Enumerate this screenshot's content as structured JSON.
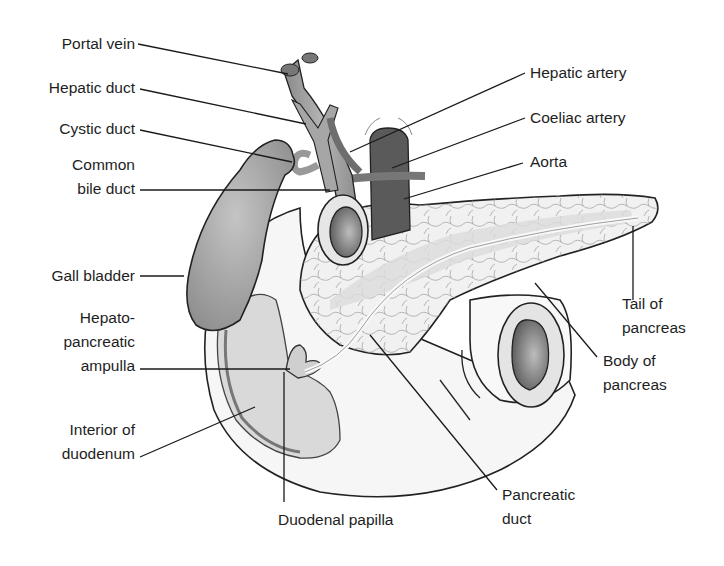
{
  "diagram": {
    "labels_left": [
      {
        "id": "portal-vein",
        "lines": [
          "Portal vein"
        ]
      },
      {
        "id": "hepatic-duct",
        "lines": [
          "Hepatic duct"
        ]
      },
      {
        "id": "cystic-duct",
        "lines": [
          "Cystic duct"
        ]
      },
      {
        "id": "common-bile-duct",
        "lines": [
          "Common",
          "bile duct"
        ]
      },
      {
        "id": "gall-bladder",
        "lines": [
          "Gall bladder"
        ]
      },
      {
        "id": "hepato-pancreatic-ampulla",
        "lines": [
          "Hepato-",
          "pancreatic",
          "ampulla"
        ]
      },
      {
        "id": "interior-of-duodenum",
        "lines": [
          "Interior of",
          "duodenum"
        ]
      }
    ],
    "labels_right": [
      {
        "id": "hepatic-artery",
        "lines": [
          "Hepatic artery"
        ]
      },
      {
        "id": "coeliac-artery",
        "lines": [
          "Coeliac artery"
        ]
      },
      {
        "id": "aorta",
        "lines": [
          "Aorta"
        ]
      },
      {
        "id": "tail-of-pancreas",
        "lines": [
          "Tail of",
          "pancreas"
        ]
      },
      {
        "id": "body-of-pancreas",
        "lines": [
          "Body of",
          "pancreas"
        ]
      }
    ],
    "labels_bottom": [
      {
        "id": "duodenal-papilla",
        "lines": [
          "Duodenal papilla"
        ]
      },
      {
        "id": "pancreatic-duct",
        "lines": [
          "Pancreatic",
          "duct"
        ]
      }
    ],
    "colors": {
      "background": "#ffffff",
      "vessel_gray": "#9a9a9a",
      "aorta_dark": "#5a5a5a",
      "gallbladder": "#a8a8a8",
      "pancreas": "#f2f2f2",
      "duodenum": "#f7f7f7",
      "mucosa": "#d6d6d6",
      "line": "#1a1a1a"
    }
  }
}
